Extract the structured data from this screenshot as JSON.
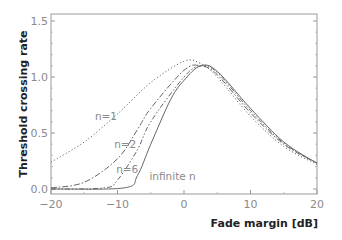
{
  "chart_data": {
    "type": "line",
    "title": "",
    "xlabel": "Fade margin [dB]",
    "ylabel": "Threshold crossing rate",
    "xlim": [
      -20,
      20
    ],
    "ylim": [
      0,
      1.5
    ],
    "xticks": [
      "-20",
      "-10",
      "0",
      "10",
      "20"
    ],
    "yticks": [
      "0.0",
      "0.5",
      "1.0",
      "1.5"
    ],
    "grid": false,
    "legend": "inline labels",
    "series": [
      {
        "name": "n=1",
        "style": "dotted",
        "x": [
          -20,
          -15,
          -10,
          -5,
          0,
          2.5,
          5,
          10,
          15,
          20
        ],
        "y": [
          0.24,
          0.42,
          0.67,
          0.95,
          1.14,
          1.12,
          1.0,
          0.65,
          0.38,
          0.22
        ]
      },
      {
        "name": "n=2",
        "style": "dash-dot",
        "x": [
          -20,
          -15,
          -10,
          -7,
          -5,
          0,
          2.5,
          5,
          10,
          15,
          20
        ],
        "y": [
          0.01,
          0.06,
          0.27,
          0.53,
          0.72,
          1.06,
          1.1,
          1.02,
          0.68,
          0.4,
          0.23
        ]
      },
      {
        "name": "n=6",
        "style": "dash-dot-dot",
        "x": [
          -20,
          -12,
          -10,
          -7,
          -5,
          0,
          2.5,
          5,
          10,
          15,
          20
        ],
        "y": [
          0.0,
          0.01,
          0.08,
          0.35,
          0.6,
          1.0,
          1.1,
          1.04,
          0.7,
          0.41,
          0.23
        ]
      },
      {
        "name": "infinite n",
        "style": "solid",
        "x": [
          -20,
          -9,
          -7,
          -5,
          -2,
          0,
          2.5,
          5,
          10,
          15,
          20
        ],
        "y": [
          0.0,
          0.01,
          0.12,
          0.4,
          0.8,
          0.97,
          1.1,
          1.05,
          0.72,
          0.42,
          0.23
        ]
      }
    ],
    "annotations": [
      {
        "text": "n=1",
        "x": -13.4,
        "y": 0.62
      },
      {
        "text": "n=2",
        "x": -10.5,
        "y": 0.37
      },
      {
        "text": "n=6",
        "x": -10.2,
        "y": 0.14
      },
      {
        "text": "infinite n",
        "x": -5.2,
        "y": 0.08
      }
    ]
  }
}
